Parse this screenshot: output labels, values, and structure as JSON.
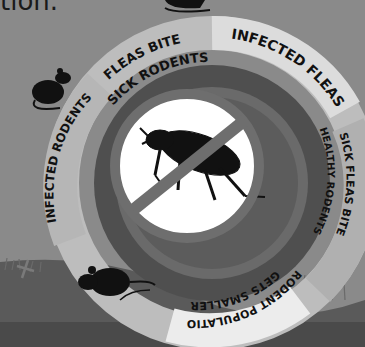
{
  "caption_fragment": "tion.",
  "cycle": {
    "title": "Flea–rodent plague cycle",
    "steps": [
      {
        "label_line1": "FLEAS BITE",
        "label_line2": "SICK RODENTS",
        "position": "top-left"
      },
      {
        "label_line1": "INFECTED FLEAS",
        "label_line2": "",
        "position": "top-right"
      },
      {
        "label_line1": "SICK FLEAS BITE",
        "label_line2": "HEALTHY RODENTS",
        "position": "right"
      },
      {
        "label_line1": "RODENT POPULATION",
        "label_line2": "GETS SMALLER",
        "position": "bottom"
      },
      {
        "label_line1": "INFECTED RODENTS",
        "label_line2": "",
        "position": "left"
      }
    ],
    "center_icon": "no-flea-icon"
  },
  "colors": {
    "background": "#8a8a8a",
    "ground": "#5a5a5a",
    "ring_outer_light": "#bdbdbd",
    "ring_outer_segment": "#a6a6a6",
    "ring_inner_dark": "#4f4f4f",
    "ring_mid": "#6a6a6a",
    "center_white": "#ffffff",
    "silhouette": "#111111",
    "highlight_segment": "#e6e6e6"
  }
}
